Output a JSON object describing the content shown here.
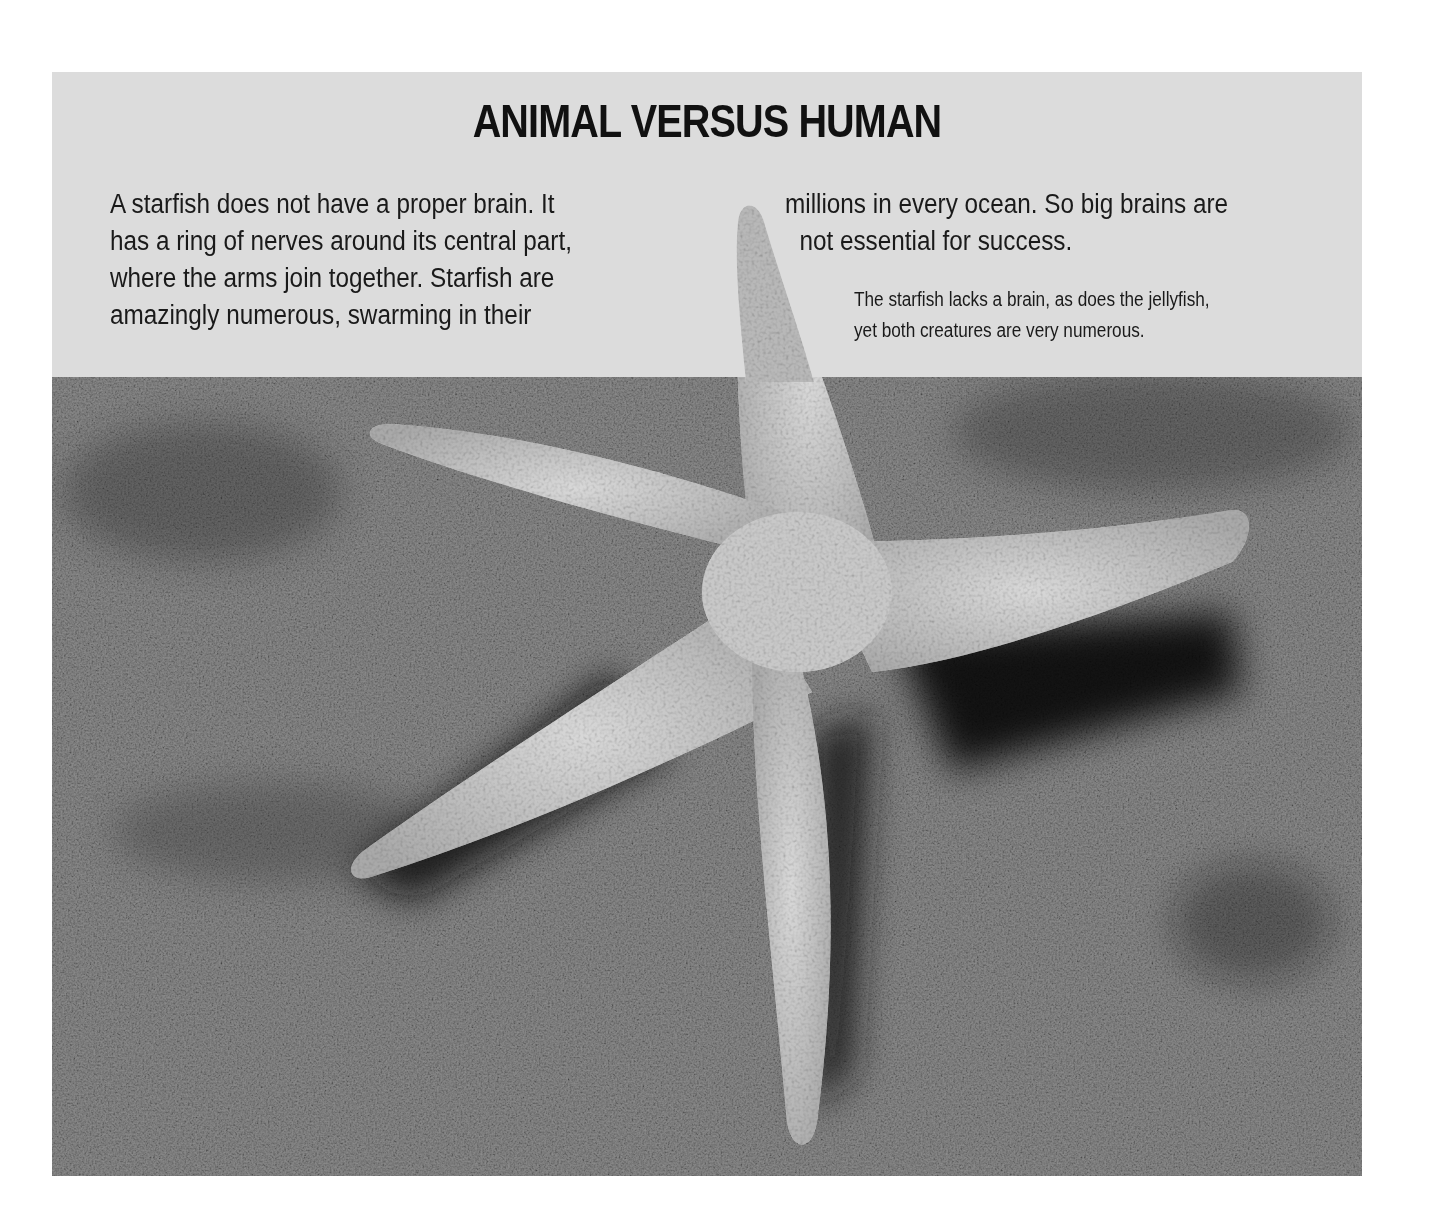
{
  "page": {
    "title": "ANIMAL VERSUS HUMAN",
    "body_left_lines": [
      "A starfish does not have a proper brain. It",
      "has a ring of nerves around its central part,",
      "where the arms join together. Starfish are",
      "amazingly numerous, swarming in their"
    ],
    "body_right_lines": [
      "millions in every ocean. So big brains are",
      "not essential for success."
    ],
    "caption_lines": [
      "The starfish lacks a brain, as does the jellyfish,",
      "yet both creatures are very numerous."
    ]
  },
  "image": {
    "subject": "starfish on sand",
    "style": "black-and-white photograph"
  },
  "colors": {
    "header_band": "#dcdcdc",
    "text": "#111111",
    "page_background": "#ffffff"
  }
}
